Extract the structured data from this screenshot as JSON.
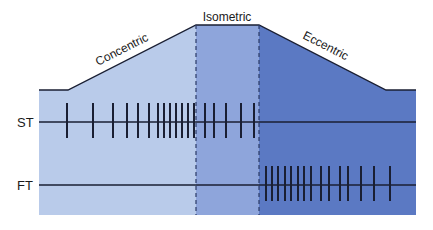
{
  "diagram": {
    "phases": [
      {
        "name": "Concentric",
        "color": "#b9cbea",
        "x_start": 39,
        "x_end": 196
      },
      {
        "name": "Isometric",
        "color": "#8ea5db",
        "x_start": 196,
        "x_end": 259
      },
      {
        "name": "Eccentric",
        "color": "#5b79c3",
        "x_start": 259,
        "x_end": 416
      }
    ],
    "outline": {
      "left_flat_y": 90,
      "plateau_y": 25,
      "right_flat_y": 90,
      "bottom_y": 215,
      "points": [
        [
          39,
          90
        ],
        [
          68,
          90
        ],
        [
          196,
          25
        ],
        [
          259,
          25
        ],
        [
          386,
          90
        ],
        [
          416,
          90
        ]
      ]
    },
    "rows": [
      {
        "label": "ST",
        "line_y": 122,
        "ticks_x": [
          67,
          93,
          113,
          127,
          138,
          149,
          158,
          164,
          170,
          176,
          182,
          188,
          194,
          205,
          214,
          226,
          241,
          254
        ]
      },
      {
        "label": "FT",
        "line_y": 185,
        "ticks_x": [
          266,
          272,
          278,
          285,
          291,
          298,
          304,
          311,
          321,
          329,
          340,
          348,
          361,
          374,
          390
        ]
      }
    ],
    "line_color": "#1a1f33",
    "dash_color": "#2a3a66"
  }
}
